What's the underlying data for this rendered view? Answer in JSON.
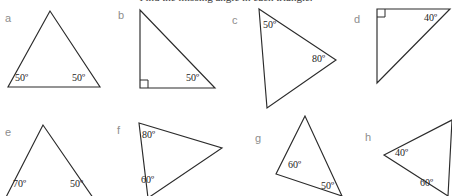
{
  "page": {
    "heading_clipped": "Find the missing angle in each triangle.",
    "background_color": "#ffffff",
    "stroke_color": "#2b2b2b",
    "letter_color": "#8d8d8d",
    "label_color": "#232323"
  },
  "figures": [
    {
      "letter": "a",
      "letter_pos": [
        5,
        13
      ],
      "shape": "triangle",
      "description": "isosceles triangle, apex up, horizontal base",
      "points": "50,11 8,87 100,87",
      "right_angle": null,
      "labels": [
        {
          "text": "50º",
          "pos": [
            15,
            73
          ]
        },
        {
          "text": "50º",
          "pos": [
            72,
            73
          ]
        }
      ]
    },
    {
      "letter": "b",
      "letter_pos": [
        118,
        10
      ],
      "shape": "triangle",
      "description": "right triangle, right angle at bottom-left, vertical left leg",
      "points": "140,10 140,88 215,88",
      "right_angle": "M 140,80 L 148,80 L 148,88",
      "labels": [
        {
          "text": "50º",
          "pos": [
            186,
            73
          ]
        }
      ]
    },
    {
      "letter": "c",
      "letter_pos": [
        232,
        15
      ],
      "shape": "triangle",
      "description": "triangle pointing right, vertical left side, bottom vertex clipped by page edge",
      "points": "259,9 336,60 267,108",
      "right_angle": null,
      "labels": [
        {
          "text": "50º",
          "pos": [
            263,
            20
          ]
        },
        {
          "text": "80º",
          "pos": [
            312,
            54
          ]
        }
      ]
    },
    {
      "letter": "d",
      "letter_pos": [
        354,
        14
      ],
      "shape": "triangle",
      "description": "right triangle, right angle at top-left, horizontal top side",
      "points": "377,9 450,9 377,83",
      "right_angle": "M 377,17 L 385,17 L 385,9",
      "labels": [
        {
          "text": "40º",
          "pos": [
            424,
            13
          ]
        }
      ]
    },
    {
      "letter": "e",
      "letter_pos": [
        5,
        127
      ],
      "shape": "triangle",
      "description": "tall narrow triangle, apex up, base clipped at page bottom",
      "points": "43,125 2,205 98,205",
      "right_angle": null,
      "labels": [
        {
          "text": "70º",
          "pos": [
            13,
            179
          ]
        },
        {
          "text": "50º",
          "pos": [
            70,
            179
          ]
        }
      ]
    },
    {
      "letter": "f",
      "letter_pos": [
        117,
        125
      ],
      "shape": "triangle",
      "description": "triangle pointing right, vertical left side, bottom vertex clipped at page bottom",
      "points": "139,123 222,148 148,198",
      "right_angle": null,
      "labels": [
        {
          "text": "80º",
          "pos": [
            142,
            130
          ]
        },
        {
          "text": "60º",
          "pos": [
            141,
            175
          ]
        }
      ]
    },
    {
      "letter": "g",
      "letter_pos": [
        255,
        133
      ],
      "shape": "triangle",
      "description": "tilted scalene triangle, apex upper right",
      "points": "305,116 276,174 342,196",
      "right_angle": null,
      "labels": [
        {
          "text": "60º",
          "pos": [
            288,
            160
          ]
        },
        {
          "text": "50º",
          "pos": [
            321,
            181
          ]
        }
      ]
    },
    {
      "letter": "h",
      "letter_pos": [
        365,
        132
      ],
      "shape": "triangle",
      "description": "triangle pointing left, vertical right side, clipped at right edge",
      "points": "384,155 452,120 448,196",
      "right_angle": null,
      "labels": [
        {
          "text": "40º",
          "pos": [
            395,
            148
          ]
        },
        {
          "text": "60º",
          "pos": [
            420,
            178
          ]
        }
      ]
    }
  ]
}
